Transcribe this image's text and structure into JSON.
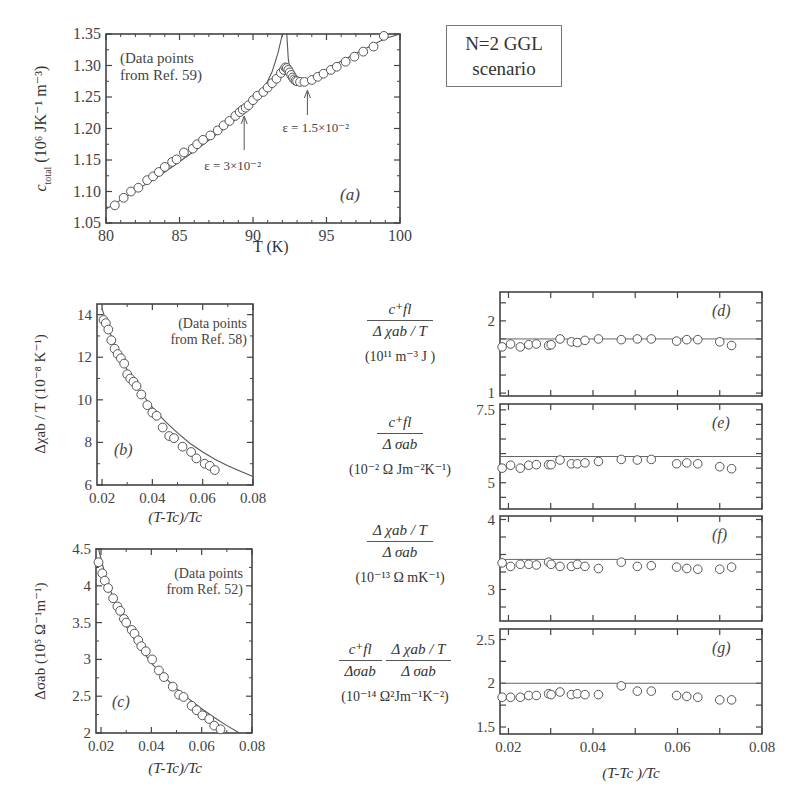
{
  "figure": {
    "scenario_label_line1": "N=2 GGL",
    "scenario_label_line2": "scenario"
  },
  "panels": {
    "a": {
      "label": "(a)",
      "annotation_line1": "(Data points",
      "annotation_line2": "from Ref. 59)",
      "xlabel": "T  (K)",
      "ylabel": "c_total (10^6 JK^-1 m^-3)",
      "ylabel_main": "c",
      "ylabel_sub": "total",
      "ylabel_units": " (10⁶ JK⁻¹ m⁻³)",
      "arrow1": "ε = 3×10⁻²",
      "arrow2": "ε = 1.5×10⁻²"
    },
    "b": {
      "label": "(b)",
      "annotation_line1": "(Data points",
      "annotation_line2": "from Ref. 58)",
      "xlabel": "(T-Tc)/Tc",
      "ylabel": "Δχab / T  (10⁻⁸ K⁻¹)"
    },
    "c": {
      "label": "(c)",
      "annotation_line1": "(Data points",
      "annotation_line2": "from Ref. 52)",
      "xlabel": "(T-Tc)/Tc",
      "ylabel": "Δσab  (10⁵ Ω⁻¹m⁻¹)"
    },
    "d": {
      "label": "(d)",
      "num": "c⁺fl",
      "den": "Δ χab / T",
      "units": "(10¹¹ m⁻³ J )"
    },
    "e": {
      "label": "(e)",
      "num": "c⁺fl",
      "den": "Δ σab",
      "units": "(10⁻² Ω Jm⁻²K⁻¹)"
    },
    "f": {
      "label": "(f)",
      "num": "Δ χab / T",
      "den": "Δ σab",
      "units": "(10⁻¹³ Ω mK⁻¹)"
    },
    "g": {
      "label": "(g)",
      "num1": "c⁺fl",
      "den1": "Δσab",
      "num2": "Δ χab / T",
      "den2": "Δ σab",
      "units": "(10⁻¹⁴ Ω²Jm⁻¹K⁻²)",
      "xlabel": "(T-Tc )/Tc"
    }
  },
  "chart_data": [
    {
      "id": "a",
      "type": "scatter",
      "title": "",
      "xlabel": "T (K)",
      "ylabel": "c_total (10^6 J K^-1 m^-3)",
      "xlim": [
        80,
        100
      ],
      "ylim": [
        1.05,
        1.35
      ],
      "xticks": [
        80,
        85,
        90,
        95,
        100
      ],
      "yticks": [
        1.05,
        1.1,
        1.15,
        1.2,
        1.25,
        1.3,
        1.35
      ],
      "xtick_labels": [
        "80",
        "85",
        "90",
        "95",
        "100"
      ],
      "ytick_labels": [
        "1.05",
        "1.10",
        "1.15",
        "1.20",
        "1.25",
        "1.30",
        "1.35"
      ],
      "annotations": [
        "(Data points from Ref. 59)",
        "(a)",
        "ε = 3×10⁻² at T≈89.4",
        "ε = 1.5×10⁻² at T≈93.7"
      ],
      "series": [
        {
          "name": "data",
          "marker": "open-circle",
          "x": [
            80.6,
            81.2,
            81.7,
            82.2,
            82.8,
            83.2,
            83.6,
            84.0,
            84.5,
            84.8,
            85.3,
            85.9,
            86.2,
            86.6,
            87.1,
            87.6,
            88.0,
            88.4,
            88.8,
            89.1,
            89.3,
            89.5,
            89.7,
            90.0,
            90.3,
            90.7,
            91.0,
            91.3,
            91.6,
            91.9,
            92.1,
            92.2,
            92.3,
            92.4,
            92.5,
            92.6,
            92.7,
            92.8,
            92.9,
            93.0,
            93.2,
            93.5,
            94.0,
            94.4,
            94.8,
            95.3,
            95.7,
            96.3,
            96.9,
            97.5,
            98.2,
            98.9
          ],
          "y": [
            1.078,
            1.09,
            1.1,
            1.106,
            1.118,
            1.124,
            1.131,
            1.139,
            1.147,
            1.151,
            1.162,
            1.168,
            1.175,
            1.182,
            1.189,
            1.197,
            1.205,
            1.212,
            1.22,
            1.226,
            1.23,
            1.233,
            1.237,
            1.245,
            1.252,
            1.258,
            1.265,
            1.272,
            1.279,
            1.288,
            1.293,
            1.297,
            1.296,
            1.293,
            1.289,
            1.285,
            1.281,
            1.278,
            1.276,
            1.275,
            1.274,
            1.274,
            1.277,
            1.282,
            1.287,
            1.293,
            1.298,
            1.306,
            1.314,
            1.322,
            1.33,
            1.347
          ]
        },
        {
          "name": "N=2 GGL fit",
          "type": "line",
          "x": [
            80,
            82,
            84,
            86,
            88,
            89,
            90,
            90.8,
            91.3,
            91.7,
            92.0
          ],
          "y": [
            1.072,
            1.101,
            1.131,
            1.164,
            1.199,
            1.218,
            1.244,
            1.266,
            1.29,
            1.32,
            1.36
          ]
        },
        {
          "name": "N=2 GGL fit (above Tc)",
          "type": "line",
          "x": [
            92.3,
            92.4,
            92.6,
            92.9,
            93.3,
            94,
            95,
            96,
            97,
            98,
            99,
            100
          ],
          "y": [
            1.36,
            1.31,
            1.285,
            1.277,
            1.274,
            1.28,
            1.293,
            1.307,
            1.319,
            1.331,
            1.343,
            1.355
          ]
        }
      ]
    },
    {
      "id": "b",
      "type": "scatter",
      "xlabel": "(T-Tc)/Tc",
      "ylabel": "Δχab / T (10^-8 K^-1)",
      "xlim": [
        0.018,
        0.08
      ],
      "ylim": [
        6,
        14.5
      ],
      "xticks": [
        0.02,
        0.04,
        0.06,
        0.08
      ],
      "yticks": [
        6,
        8,
        10,
        12,
        14
      ],
      "annotations": [
        "(Data points from Ref. 58)",
        "(b)"
      ],
      "series": [
        {
          "name": "data",
          "marker": "open-circle",
          "x": [
            0.0206,
            0.0215,
            0.0225,
            0.0237,
            0.025,
            0.0262,
            0.0275,
            0.0288,
            0.03,
            0.0312,
            0.0325,
            0.0337,
            0.0356,
            0.038,
            0.04,
            0.0417,
            0.0441,
            0.0467,
            0.0486,
            0.052,
            0.0554,
            0.0575,
            0.0608,
            0.0628,
            0.0648,
            0.0676,
            0.0693,
            0.0715
          ],
          "y": [
            13.75,
            13.6,
            13.3,
            12.8,
            12.4,
            12.15,
            11.95,
            11.7,
            11.2,
            11.0,
            10.85,
            10.65,
            10.25,
            9.75,
            9.4,
            9.25,
            8.7,
            8.3,
            8.2,
            7.8,
            7.55,
            7.25,
            7.0,
            6.9,
            6.7,
            0,
            0,
            0
          ]
        },
        {
          "name": "fit",
          "type": "line",
          "x": [
            0.02,
            0.022,
            0.025,
            0.03,
            0.035,
            0.04,
            0.045,
            0.05,
            0.055,
            0.06,
            0.065,
            0.07,
            0.075,
            0.08
          ],
          "y": [
            14.3,
            13.5,
            12.6,
            11.4,
            10.4,
            9.65,
            9.0,
            8.45,
            7.95,
            7.55,
            7.2,
            6.9,
            6.65,
            6.4
          ]
        }
      ]
    },
    {
      "id": "c",
      "type": "scatter",
      "xlabel": "(T-Tc)/Tc",
      "ylabel": "Δσab (10^5 Ω^-1 m^-1)",
      "xlim": [
        0.018,
        0.08
      ],
      "ylim": [
        2,
        4.5
      ],
      "xticks": [
        0.02,
        0.04,
        0.06,
        0.08
      ],
      "yticks": [
        2,
        2.5,
        3,
        3.5,
        4,
        4.5
      ],
      "annotations": [
        "(Data points from Ref. 52)",
        "(c)"
      ],
      "series": [
        {
          "name": "data",
          "marker": "open-circle",
          "x": [
            0.019,
            0.0205,
            0.0215,
            0.0228,
            0.0248,
            0.0265,
            0.0276,
            0.0291,
            0.03,
            0.0322,
            0.0333,
            0.0348,
            0.036,
            0.0378,
            0.0403,
            0.043,
            0.045,
            0.0485,
            0.051,
            0.0528,
            0.056,
            0.058,
            0.0603,
            0.063,
            0.065,
            0.0675,
            0.07
          ],
          "y": [
            4.32,
            4.17,
            4.07,
            3.97,
            3.83,
            3.72,
            3.66,
            3.55,
            3.5,
            3.4,
            3.35,
            3.26,
            3.18,
            3.11,
            3.0,
            2.85,
            2.76,
            2.63,
            2.52,
            2.49,
            2.37,
            2.31,
            2.24,
            2.19,
            2.1,
            2.05,
            0
          ]
        },
        {
          "name": "fit",
          "type": "line",
          "x": [
            0.019,
            0.022,
            0.025,
            0.03,
            0.035,
            0.04,
            0.045,
            0.05,
            0.055,
            0.06,
            0.065,
            0.07,
            0.075
          ],
          "y": [
            4.5,
            4.1,
            3.82,
            3.45,
            3.18,
            2.95,
            2.77,
            2.6,
            2.46,
            2.33,
            2.21,
            2.1,
            2.0
          ]
        }
      ]
    },
    {
      "id": "d",
      "type": "scatter",
      "ylabel": "c+fl / (Δχab/T) (10^11 m^-3 J)",
      "xlim": [
        0.018,
        0.08
      ],
      "ylim": [
        1,
        2.4
      ],
      "yticks": [
        1,
        2
      ],
      "annotations": [
        "(d)"
      ],
      "reference_line": 1.75,
      "series": [
        {
          "name": "data",
          "marker": "open-circle",
          "x": [
            0.0185,
            0.0205,
            0.0228,
            0.0248,
            0.0266,
            0.0295,
            0.0301,
            0.0322,
            0.0349,
            0.0363,
            0.0381,
            0.0413,
            0.0467,
            0.0505,
            0.0538,
            0.0598,
            0.0622,
            0.0648,
            0.07,
            0.0728
          ],
          "y": [
            1.64,
            1.68,
            1.64,
            1.67,
            1.68,
            1.66,
            1.67,
            1.75,
            1.71,
            1.7,
            1.73,
            1.75,
            1.74,
            1.75,
            1.75,
            1.72,
            1.74,
            1.74,
            1.71,
            1.66
          ]
        }
      ]
    },
    {
      "id": "e",
      "type": "scatter",
      "ylabel": "c+fl / Δσab (10^-2 Ω J m^-2 K^-1)",
      "xlim": [
        0.018,
        0.08
      ],
      "ylim": [
        4,
        7.5
      ],
      "yticks": [
        5,
        7.5
      ],
      "annotations": [
        "(e)"
      ],
      "reference_line": 5.9,
      "series": [
        {
          "name": "data",
          "marker": "open-circle",
          "x": [
            0.0185,
            0.0205,
            0.0228,
            0.0248,
            0.0266,
            0.0295,
            0.0301,
            0.0322,
            0.0349,
            0.0363,
            0.0381,
            0.0413,
            0.0467,
            0.0505,
            0.0538,
            0.0598,
            0.0622,
            0.0648,
            0.07,
            0.0728
          ],
          "y": [
            5.5,
            5.6,
            5.5,
            5.6,
            5.62,
            5.62,
            5.62,
            5.78,
            5.65,
            5.65,
            5.68,
            5.73,
            5.8,
            5.78,
            5.8,
            5.65,
            5.68,
            5.65,
            5.55,
            5.48
          ]
        }
      ]
    },
    {
      "id": "f",
      "type": "scatter",
      "ylabel": "(Δχab/T) / Δσab (10^-13 Ω m K^-1)",
      "xlim": [
        0.018,
        0.08
      ],
      "ylim": [
        2.5,
        4
      ],
      "yticks": [
        3,
        4
      ],
      "annotations": [
        "(f)"
      ],
      "reference_line": 3.43,
      "series": [
        {
          "name": "data",
          "marker": "open-circle",
          "x": [
            0.0185,
            0.0205,
            0.0228,
            0.0248,
            0.0266,
            0.0295,
            0.0301,
            0.0322,
            0.0349,
            0.0363,
            0.0381,
            0.0413,
            0.0467,
            0.0505,
            0.0538,
            0.0598,
            0.0622,
            0.0648,
            0.07,
            0.0728
          ],
          "y": [
            3.38,
            3.33,
            3.36,
            3.36,
            3.35,
            3.39,
            3.36,
            3.33,
            3.33,
            3.36,
            3.33,
            3.3,
            3.39,
            3.33,
            3.34,
            3.32,
            3.3,
            3.29,
            3.29,
            3.32
          ]
        }
      ]
    },
    {
      "id": "g",
      "type": "scatter",
      "xlabel": "(T-Tc)/Tc",
      "ylabel": "(c+fl/Δσab)(Δχab/T)/Δσab (10^-14 Ω^2 J m^-1 K^-2)",
      "xlim": [
        0.018,
        0.08
      ],
      "ylim": [
        1.4,
        2.6
      ],
      "xticks": [
        0.02,
        0.04,
        0.06,
        0.08
      ],
      "yticks": [
        1.5,
        2,
        2.5
      ],
      "annotations": [
        "(g)"
      ],
      "reference_line": 2.0,
      "series": [
        {
          "name": "data",
          "marker": "open-circle",
          "x": [
            0.0185,
            0.0205,
            0.0228,
            0.0248,
            0.0266,
            0.0295,
            0.0301,
            0.0322,
            0.0349,
            0.0363,
            0.0381,
            0.0413,
            0.0467,
            0.0505,
            0.0538,
            0.0598,
            0.0622,
            0.0648,
            0.07,
            0.0728
          ],
          "y": [
            1.84,
            1.84,
            1.84,
            1.86,
            1.86,
            1.88,
            1.87,
            1.9,
            1.87,
            1.88,
            1.87,
            1.87,
            1.97,
            1.91,
            1.91,
            1.86,
            1.85,
            1.84,
            1.81,
            1.81
          ]
        }
      ]
    }
  ]
}
